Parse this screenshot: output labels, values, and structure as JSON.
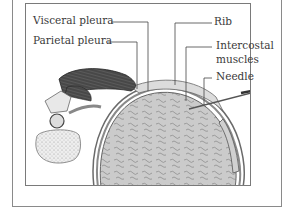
{
  "diagram": {
    "labels": {
      "visceral_pleura": "Visceral pleura",
      "parietal_pleura": "Parietal pleura",
      "rib": "Rib",
      "intercostal_muscles_line1": "Intercostal",
      "intercostal_muscles_line2": "muscles",
      "needle": "Needle"
    },
    "colors": {
      "frame": "#8a8a8a",
      "text": "#3a3a3a",
      "lung_fill": "#c9c9c9",
      "muscle_fill": "#4a4a4a",
      "bone_fill": "#e6e6e6"
    }
  }
}
